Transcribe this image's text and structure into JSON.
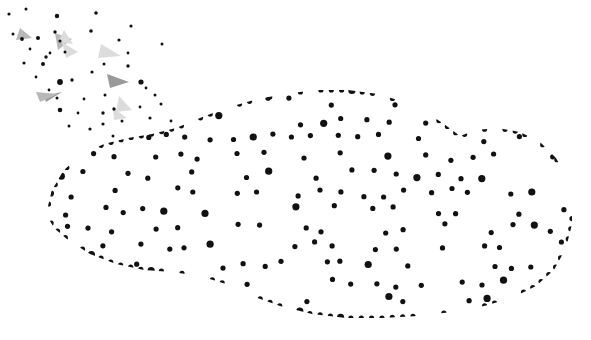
{
  "artwork": {
    "title": "Low Poly Polygonal Car",
    "subject": "car-side-view",
    "orientation": "facing-right",
    "style": "low-poly wireframe mesh with vertex dots and dispersing particle debris",
    "canvas": {
      "width": 591,
      "height": 340
    },
    "background_color": "#ffffff",
    "alt_text": "Grayscale low-poly triangulated side view of a sports car facing right, with small dots and thin triangular shards scattering off toward the upper left."
  },
  "palette": {
    "background": "#ffffff",
    "node": "#111111",
    "edge": "#5a5a5a",
    "edge_light": "#8a8a8a",
    "fill_white": "#ffffff",
    "fill_lightest": "#f2f2f2",
    "fill_light": "#e4e4e4",
    "fill_mid_light": "#d2d2d2",
    "fill_mid": "#bdbdbd",
    "fill_mid_dark": "#a8a8a8",
    "fill_dark": "#959595",
    "fill_darkest": "#868686",
    "shard_light": "#dcdcdc",
    "shard_mid": "#b8b8b8",
    "shard_dark": "#9a9a9a"
  },
  "mesh": {
    "node_radius": 2.6,
    "node_radius_large": 3.6,
    "edge_width": 0.7,
    "vertices": [
      [
        118,
        196
      ],
      [
        128,
        180
      ],
      [
        140,
        165
      ],
      [
        152,
        152
      ],
      [
        168,
        140
      ],
      [
        186,
        131
      ],
      [
        206,
        124
      ],
      [
        228,
        119
      ],
      [
        141,
        188
      ],
      [
        156,
        174
      ],
      [
        172,
        161
      ],
      [
        190,
        150
      ],
      [
        210,
        141
      ],
      [
        232,
        134
      ],
      [
        256,
        128
      ],
      [
        280,
        124
      ],
      [
        133,
        212
      ],
      [
        146,
        202
      ],
      [
        162,
        192
      ],
      [
        180,
        182
      ],
      [
        200,
        173
      ],
      [
        222,
        165
      ],
      [
        246,
        158
      ],
      [
        270,
        152
      ],
      [
        124,
        228
      ],
      [
        140,
        222
      ],
      [
        158,
        214
      ],
      [
        178,
        206
      ],
      [
        200,
        198
      ],
      [
        224,
        191
      ],
      [
        250,
        185
      ],
      [
        276,
        180
      ],
      [
        130,
        248
      ],
      [
        148,
        244
      ],
      [
        168,
        238
      ],
      [
        190,
        232
      ],
      [
        214,
        226
      ],
      [
        240,
        221
      ],
      [
        266,
        216
      ],
      [
        292,
        212
      ],
      [
        152,
        268
      ],
      [
        172,
        266
      ],
      [
        194,
        262
      ],
      [
        218,
        257
      ],
      [
        244,
        252
      ],
      [
        270,
        248
      ],
      [
        296,
        244
      ],
      [
        322,
        240
      ],
      [
        252,
        122
      ],
      [
        278,
        118
      ],
      [
        304,
        116
      ],
      [
        330,
        116
      ],
      [
        356,
        118
      ],
      [
        382,
        122
      ],
      [
        406,
        128
      ],
      [
        428,
        136
      ],
      [
        300,
        120
      ],
      [
        326,
        118
      ],
      [
        352,
        119
      ],
      [
        378,
        123
      ],
      [
        402,
        129
      ],
      [
        424,
        137
      ],
      [
        444,
        148
      ],
      [
        462,
        161
      ],
      [
        294,
        148
      ],
      [
        320,
        144
      ],
      [
        346,
        142
      ],
      [
        372,
        143
      ],
      [
        398,
        146
      ],
      [
        422,
        152
      ],
      [
        446,
        161
      ],
      [
        468,
        173
      ],
      [
        300,
        176
      ],
      [
        326,
        172
      ],
      [
        352,
        170
      ],
      [
        378,
        170
      ],
      [
        404,
        172
      ],
      [
        430,
        177
      ],
      [
        454,
        185
      ],
      [
        476,
        196
      ],
      [
        318,
        208
      ],
      [
        344,
        204
      ],
      [
        370,
        202
      ],
      [
        396,
        202
      ],
      [
        422,
        205
      ],
      [
        448,
        211
      ],
      [
        472,
        219
      ],
      [
        494,
        230
      ],
      [
        348,
        236
      ],
      [
        374,
        233
      ],
      [
        400,
        232
      ],
      [
        426,
        234
      ],
      [
        452,
        239
      ],
      [
        478,
        247
      ],
      [
        500,
        257
      ],
      [
        518,
        268
      ],
      [
        346,
        262
      ],
      [
        372,
        259
      ],
      [
        398,
        258
      ],
      [
        424,
        260
      ],
      [
        450,
        265
      ],
      [
        476,
        273
      ],
      [
        498,
        282
      ],
      [
        516,
        292
      ],
      [
        452,
        140
      ],
      [
        472,
        150
      ],
      [
        490,
        163
      ],
      [
        506,
        178
      ],
      [
        518,
        195
      ],
      [
        527,
        214
      ],
      [
        532,
        234
      ],
      [
        533,
        252
      ],
      [
        470,
        135
      ],
      [
        492,
        146
      ],
      [
        512,
        160
      ],
      [
        528,
        177
      ],
      [
        541,
        196
      ],
      [
        550,
        217
      ],
      [
        554,
        238
      ],
      [
        552,
        258
      ],
      [
        490,
        132
      ],
      [
        512,
        144
      ],
      [
        532,
        159
      ],
      [
        548,
        177
      ],
      [
        560,
        198
      ],
      [
        567,
        220
      ],
      [
        569,
        241
      ],
      [
        563,
        262
      ],
      [
        228,
        232
      ],
      [
        244,
        240
      ],
      [
        262,
        248
      ],
      [
        280,
        252
      ],
      [
        298,
        250
      ],
      [
        312,
        242
      ],
      [
        320,
        230
      ],
      [
        318,
        218
      ],
      [
        246,
        262
      ],
      [
        264,
        272
      ],
      [
        284,
        280
      ],
      [
        304,
        284
      ],
      [
        322,
        282
      ],
      [
        338,
        274
      ],
      [
        348,
        262
      ],
      [
        350,
        248
      ],
      [
        262,
        288
      ],
      [
        282,
        298
      ],
      [
        302,
        306
      ],
      [
        322,
        310
      ],
      [
        342,
        308
      ],
      [
        358,
        300
      ],
      [
        370,
        288
      ],
      [
        374,
        272
      ],
      [
        410,
        258
      ],
      [
        428,
        266
      ],
      [
        446,
        276
      ],
      [
        464,
        284
      ],
      [
        482,
        288
      ],
      [
        500,
        286
      ],
      [
        514,
        278
      ],
      [
        522,
        266
      ],
      [
        404,
        282
      ],
      [
        422,
        292
      ],
      [
        440,
        302
      ],
      [
        458,
        310
      ],
      [
        476,
        314
      ],
      [
        494,
        312
      ],
      [
        510,
        304
      ],
      [
        520,
        292
      ],
      [
        96,
        170
      ],
      [
        104,
        158
      ],
      [
        118,
        148
      ],
      [
        134,
        142
      ],
      [
        152,
        138
      ],
      [
        170,
        136
      ],
      [
        70,
        182
      ],
      [
        78,
        166
      ],
      [
        60,
        196
      ],
      [
        66,
        212
      ],
      [
        78,
        226
      ],
      [
        94,
        238
      ],
      [
        112,
        246
      ],
      [
        132,
        252
      ],
      [
        154,
        256
      ],
      [
        176,
        258
      ],
      [
        48,
        212
      ],
      [
        52,
        232
      ],
      [
        64,
        248
      ],
      [
        82,
        260
      ],
      [
        104,
        268
      ],
      [
        128,
        272
      ],
      [
        152,
        274
      ],
      [
        176,
        272
      ],
      [
        198,
        274
      ],
      [
        220,
        278
      ],
      [
        242,
        284
      ],
      [
        264,
        292
      ],
      [
        288,
        300
      ],
      [
        312,
        306
      ],
      [
        338,
        310
      ],
      [
        362,
        312
      ],
      [
        386,
        310
      ],
      [
        410,
        306
      ],
      [
        434,
        302
      ],
      [
        458,
        300
      ],
      [
        482,
        298
      ],
      [
        504,
        294
      ],
      [
        524,
        286
      ],
      [
        540,
        274
      ],
      [
        548,
        258
      ],
      [
        556,
        240
      ],
      [
        560,
        222
      ],
      [
        558,
        204
      ],
      [
        550,
        186
      ],
      [
        538,
        170
      ],
      [
        522,
        157
      ],
      [
        504,
        147
      ]
    ]
  },
  "car_silhouette": {
    "outline_path": "M 46 214 L 52 190 L 64 170 L 82 154 L 104 144 L 128 138 L 152 134 L 176 128 L 200 118 L 226 108 L 254 100 L 284 94 L 316 90 L 348 90 L 378 94 L 404 102 L 426 112 L 444 124 L 460 136 L 476 130 L 498 128 L 520 132 L 540 142 L 556 158 L 567 178 L 572 200 L 572 224 L 566 248 L 554 270 L 536 286 L 512 298 L 484 306 L 452 312 L 418 316 L 382 318 L 346 318 L 312 314 L 280 306 L 252 296 L 226 284 L 200 276 L 172 272 L 144 270 L 116 264 L 90 254 L 68 240 L 54 228 Z",
    "description": "Rounded low-poly car body, rear at left, nose at right, with two wheel arch depressions along the lower edge"
  },
  "triangles_note": "Triangle fills vary across eight grayscale steps from white to #868686; darker facets cluster at the rear quarter panel, the wheel arches, the hood shadow and the windscreen pillar.",
  "particles": {
    "description": "Dispersing fragments trailing off the rear of the car toward the upper-left corner",
    "dot_count": 46,
    "shard_count": 10,
    "dots": [
      [
        9,
        14,
        1.6
      ],
      [
        26,
        9,
        1.5
      ],
      [
        57,
        16,
        2.2
      ],
      [
        96,
        13,
        1.8
      ],
      [
        60,
        41,
        1.6
      ],
      [
        30,
        49,
        1.4
      ],
      [
        13,
        34,
        1.5
      ],
      [
        22,
        39,
        1.9
      ],
      [
        38,
        38,
        2.0
      ],
      [
        55,
        32,
        1.7
      ],
      [
        91,
        31,
        1.8
      ],
      [
        131,
        26,
        1.6
      ],
      [
        46,
        57,
        1.7
      ],
      [
        65,
        52,
        1.5
      ],
      [
        119,
        40,
        1.6
      ],
      [
        162,
        44,
        1.5
      ],
      [
        24,
        63,
        1.6
      ],
      [
        43,
        64,
        2.0
      ],
      [
        50,
        53,
        1.4
      ],
      [
        60,
        82,
        2.9
      ],
      [
        72,
        80,
        1.7
      ],
      [
        92,
        72,
        1.6
      ],
      [
        104,
        64,
        1.5
      ],
      [
        128,
        66,
        1.7
      ],
      [
        141,
        82,
        2.6
      ],
      [
        105,
        95,
        1.5
      ],
      [
        114,
        109,
        1.7
      ],
      [
        155,
        95,
        1.5
      ],
      [
        146,
        88,
        1.4
      ],
      [
        103,
        113,
        1.7
      ],
      [
        60,
        110,
        2.3
      ],
      [
        57,
        98,
        1.5
      ],
      [
        84,
        99,
        1.4
      ],
      [
        103,
        124,
        1.6
      ],
      [
        122,
        121,
        1.5
      ],
      [
        90,
        129,
        1.6
      ],
      [
        69,
        126,
        1.5
      ],
      [
        140,
        107,
        1.4
      ],
      [
        150,
        118,
        1.6
      ],
      [
        161,
        104,
        1.5
      ],
      [
        171,
        121,
        1.4
      ],
      [
        113,
        136,
        1.5
      ],
      [
        78,
        113,
        1.4
      ],
      [
        36,
        77,
        1.4
      ],
      [
        49,
        90,
        1.4
      ],
      [
        128,
        53,
        1.4
      ]
    ],
    "shards": [
      {
        "points": "20,28 32,38 16,40",
        "tone": "shard_mid"
      },
      {
        "points": "55,33 72,39 58,50",
        "tone": "shard_mid"
      },
      {
        "points": "64,30 73,44 58,42",
        "tone": "shard_light"
      },
      {
        "points": "62,42 78,52 66,58",
        "tone": "shard_light"
      },
      {
        "points": "101,44 121,56 98,58",
        "tone": "shard_light"
      },
      {
        "points": "107,74 129,82 110,88",
        "tone": "shard_dark"
      },
      {
        "points": "119,96 132,110 116,112",
        "tone": "shard_light"
      },
      {
        "points": "44,96 62,92 46,102",
        "tone": "shard_dark"
      },
      {
        "points": "36,92 58,94 40,102",
        "tone": "shard_mid"
      },
      {
        "points": "113,108 127,118 114,120",
        "tone": "shard_light"
      }
    ]
  }
}
